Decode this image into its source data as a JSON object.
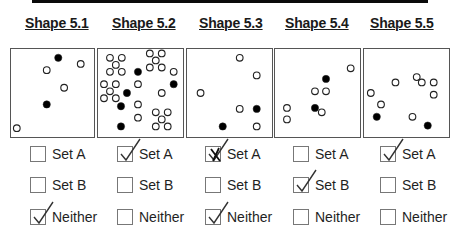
{
  "banner": {
    "text": "",
    "color": "#0a0a0a"
  },
  "legend": {
    "filled_point": "filled circle",
    "open_point": "open circle"
  },
  "option_labels": [
    "Set A",
    "Set B",
    "Neither"
  ],
  "shapes": [
    {
      "title": "Shape 5.1",
      "points": [
        {
          "x": 0.57,
          "y": 0.1,
          "filled": true
        },
        {
          "x": 0.84,
          "y": 0.17,
          "filled": false
        },
        {
          "x": 0.43,
          "y": 0.24,
          "filled": false
        },
        {
          "x": 0.64,
          "y": 0.44,
          "filled": false
        },
        {
          "x": 0.43,
          "y": 0.63,
          "filled": true
        },
        {
          "x": 0.07,
          "y": 0.9,
          "filled": false
        }
      ],
      "options": [
        {
          "label": "Set A",
          "mark": "none"
        },
        {
          "label": "Set B",
          "mark": "none"
        },
        {
          "label": "Neither",
          "mark": "check"
        }
      ]
    },
    {
      "title": "Shape 5.2",
      "points": [
        {
          "x": 0.14,
          "y": 0.1,
          "filled": false
        },
        {
          "x": 0.28,
          "y": 0.1,
          "filled": false
        },
        {
          "x": 0.21,
          "y": 0.18,
          "filled": false
        },
        {
          "x": 0.14,
          "y": 0.26,
          "filled": false
        },
        {
          "x": 0.28,
          "y": 0.26,
          "filled": false
        },
        {
          "x": 0.61,
          "y": 0.05,
          "filled": false
        },
        {
          "x": 0.75,
          "y": 0.05,
          "filled": false
        },
        {
          "x": 0.68,
          "y": 0.13,
          "filled": false
        },
        {
          "x": 0.61,
          "y": 0.21,
          "filled": false
        },
        {
          "x": 0.75,
          "y": 0.21,
          "filled": false
        },
        {
          "x": 0.47,
          "y": 0.26,
          "filled": true
        },
        {
          "x": 0.89,
          "y": 0.26,
          "filled": false
        },
        {
          "x": 0.07,
          "y": 0.4,
          "filled": false
        },
        {
          "x": 0.21,
          "y": 0.4,
          "filled": false
        },
        {
          "x": 0.14,
          "y": 0.48,
          "filled": false
        },
        {
          "x": 0.07,
          "y": 0.56,
          "filled": false
        },
        {
          "x": 0.21,
          "y": 0.56,
          "filled": false
        },
        {
          "x": 0.47,
          "y": 0.4,
          "filled": false
        },
        {
          "x": 0.89,
          "y": 0.4,
          "filled": true
        },
        {
          "x": 0.34,
          "y": 0.5,
          "filled": true
        },
        {
          "x": 0.75,
          "y": 0.5,
          "filled": false
        },
        {
          "x": 0.27,
          "y": 0.65,
          "filled": true
        },
        {
          "x": 0.47,
          "y": 0.63,
          "filled": false
        },
        {
          "x": 0.47,
          "y": 0.78,
          "filled": false
        },
        {
          "x": 0.68,
          "y": 0.72,
          "filled": false
        },
        {
          "x": 0.82,
          "y": 0.72,
          "filled": false
        },
        {
          "x": 0.75,
          "y": 0.8,
          "filled": false
        },
        {
          "x": 0.68,
          "y": 0.88,
          "filled": false
        },
        {
          "x": 0.82,
          "y": 0.88,
          "filled": false
        },
        {
          "x": 0.27,
          "y": 0.88,
          "filled": true
        }
      ],
      "options": [
        {
          "label": "Set A",
          "mark": "check"
        },
        {
          "label": "Set B",
          "mark": "none"
        },
        {
          "label": "Neither",
          "mark": "none"
        }
      ]
    },
    {
      "title": "Shape 5.3",
      "points": [
        {
          "x": 0.62,
          "y": 0.1,
          "filled": false
        },
        {
          "x": 0.82,
          "y": 0.3,
          "filled": false
        },
        {
          "x": 0.16,
          "y": 0.5,
          "filled": false
        },
        {
          "x": 0.62,
          "y": 0.68,
          "filled": false
        },
        {
          "x": 0.82,
          "y": 0.68,
          "filled": true
        },
        {
          "x": 0.42,
          "y": 0.88,
          "filled": true
        },
        {
          "x": 0.82,
          "y": 0.88,
          "filled": false
        }
      ],
      "options": [
        {
          "label": "Set A",
          "mark": "crossed-check"
        },
        {
          "label": "Set B",
          "mark": "none"
        },
        {
          "label": "Neither",
          "mark": "check"
        }
      ]
    },
    {
      "title": "Shape 5.4",
      "points": [
        {
          "x": 0.89,
          "y": 0.22,
          "filled": false
        },
        {
          "x": 0.6,
          "y": 0.34,
          "filled": true
        },
        {
          "x": 0.47,
          "y": 0.48,
          "filled": false
        },
        {
          "x": 0.6,
          "y": 0.48,
          "filled": false
        },
        {
          "x": 0.47,
          "y": 0.67,
          "filled": true
        },
        {
          "x": 0.55,
          "y": 0.72,
          "filled": false
        },
        {
          "x": 0.14,
          "y": 0.67,
          "filled": false
        },
        {
          "x": 0.14,
          "y": 0.8,
          "filled": false
        }
      ],
      "options": [
        {
          "label": "Set A",
          "mark": "none"
        },
        {
          "label": "Set B",
          "mark": "check"
        },
        {
          "label": "Neither",
          "mark": "none"
        }
      ]
    },
    {
      "title": "Shape 5.5",
      "points": [
        {
          "x": 0.62,
          "y": 0.32,
          "filled": false
        },
        {
          "x": 0.68,
          "y": 0.38,
          "filled": false
        },
        {
          "x": 0.82,
          "y": 0.38,
          "filled": false
        },
        {
          "x": 0.37,
          "y": 0.38,
          "filled": false
        },
        {
          "x": 0.82,
          "y": 0.52,
          "filled": false
        },
        {
          "x": 0.08,
          "y": 0.5,
          "filled": false
        },
        {
          "x": 0.2,
          "y": 0.63,
          "filled": false
        },
        {
          "x": 0.15,
          "y": 0.77,
          "filled": true
        },
        {
          "x": 0.57,
          "y": 0.77,
          "filled": false
        },
        {
          "x": 0.75,
          "y": 0.87,
          "filled": true
        }
      ],
      "options": [
        {
          "label": "Set A",
          "mark": "check"
        },
        {
          "label": "Set B",
          "mark": "none"
        },
        {
          "label": "Neither",
          "mark": "none"
        }
      ]
    }
  ]
}
